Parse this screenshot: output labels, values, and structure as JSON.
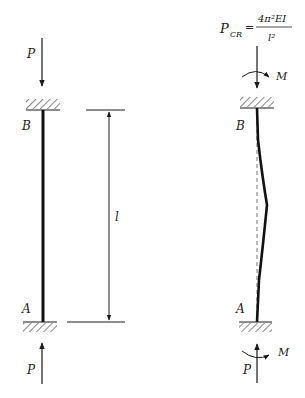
{
  "diagram": {
    "formula": {
      "lhs": "P",
      "lhs_sub": "CR",
      "equals": "=",
      "numerator": "4π²EI",
      "denominator": "l²"
    },
    "left_column": {
      "top_load": "P",
      "bottom_load": "P",
      "top_point": "B",
      "bottom_point": "A",
      "length_label": "l"
    },
    "right_column": {
      "top_point": "B",
      "bottom_point": "A",
      "top_moment": "M",
      "bottom_moment": "M"
    },
    "colors": {
      "line": "#1a1a1a",
      "hatch": "#333333",
      "dashed": "#777777"
    }
  }
}
